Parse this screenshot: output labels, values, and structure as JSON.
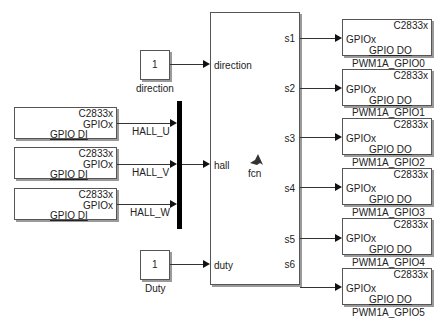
{
  "constants": [
    {
      "value": "1",
      "label": "direction"
    },
    {
      "value": "1",
      "label": "Duty"
    }
  ],
  "gpio_inputs": [
    {
      "target": "C2833x",
      "port": "GPIOx",
      "type": "GPIO DI",
      "signal": "HALL_U"
    },
    {
      "target": "C2833x",
      "port": "GPIOx",
      "type": "GPIO DI",
      "signal": "HALL_V"
    },
    {
      "target": "C2833x",
      "port": "GPIOx",
      "type": "GPIO DI",
      "signal": "HALL_W"
    }
  ],
  "function_block": {
    "name": "fcn",
    "inputs": [
      "direction",
      "hall",
      "duty"
    ],
    "outputs": [
      "s1",
      "s2",
      "s3",
      "s4",
      "s5",
      "s6"
    ]
  },
  "gpio_outputs": [
    {
      "target": "C2833x",
      "port": "GPIOx",
      "type": "GPIO DO",
      "label": "PWM1A_GPIO0"
    },
    {
      "target": "C2833x",
      "port": "GPIOx",
      "type": "GPIO DO",
      "label": "PWM1A_GPIO1"
    },
    {
      "target": "C2833x",
      "port": "GPIOx",
      "type": "GPIO DO",
      "label": "PWM1A_GPIO2"
    },
    {
      "target": "C2833x",
      "port": "GPIOx",
      "type": "GPIO DO",
      "label": "PWM1A_GPIO3"
    },
    {
      "target": "C2833x",
      "port": "GPIOx",
      "type": "GPIO DO",
      "label": "PWM1A_GPIO4"
    },
    {
      "target": "C2833x",
      "port": "GPIOx",
      "type": "GPIO DO",
      "label": "PWM1A_GPIO5"
    }
  ]
}
